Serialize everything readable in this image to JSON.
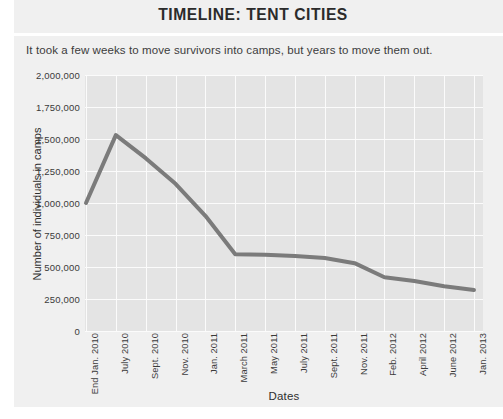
{
  "chart_data": {
    "type": "line",
    "title": "TIMELINE: TENT CITIES",
    "subtitle": "It took a few weeks to move survivors into camps, but years to move them out.",
    "xlabel": "Dates",
    "ylabel": "Number of individuals in camps",
    "ylim": [
      0,
      2000000
    ],
    "ytick_step": 250000,
    "ytick_labels": [
      "2,000,000",
      "1,750,000",
      "1,500,000",
      "1,250,000",
      "1,000,000",
      "750,000",
      "500,000",
      "250,000",
      "0"
    ],
    "ytick_values": [
      2000000,
      1750000,
      1500000,
      1250000,
      1000000,
      750000,
      500000,
      250000,
      0
    ],
    "grid": true,
    "legend": "none",
    "categories": [
      "End Jan. 2010",
      "July 2010",
      "Sept. 2010",
      "Nov. 2010",
      "Jan. 2011",
      "March 2011",
      "May 2011",
      "July 2011",
      "Sept. 2011",
      "Nov. 2011",
      "Feb. 2012",
      "April 2012",
      "June 2012",
      "Jan. 2013"
    ],
    "values": [
      1000000,
      1530000,
      1350000,
      1150000,
      900000,
      600000,
      595000,
      585000,
      570000,
      530000,
      420000,
      390000,
      350000,
      320000
    ],
    "series_color": "#7b7b7b",
    "plot_background": "#e4e4e4",
    "gridline_color": "#fbfbfb",
    "panel_background": "#f0f0f0"
  }
}
